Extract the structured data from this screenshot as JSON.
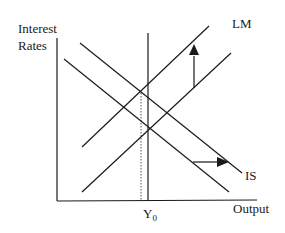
{
  "diagram": {
    "type": "IS-LM model",
    "y_axis_label_line1": "Interest",
    "y_axis_label_line2": "Rates",
    "x_axis_label": "Output",
    "lm_label": "LM",
    "is_label": "IS",
    "y0_label_main": "Y",
    "y0_label_sub": "0",
    "curves": [
      {
        "name": "LM (original)",
        "from": [
          82,
          192
        ],
        "to": [
          231,
          53
        ]
      },
      {
        "name": "LM (shifted up)",
        "from": [
          82,
          147
        ],
        "to": [
          209,
          26
        ]
      },
      {
        "name": "IS (original)",
        "from": [
          64,
          59
        ],
        "to": [
          229,
          192
        ]
      },
      {
        "name": "IS (shifted right)",
        "from": [
          80,
          43
        ],
        "to": [
          242,
          173
        ]
      }
    ],
    "shifts": [
      {
        "curve": "LM",
        "direction": "up"
      },
      {
        "curve": "IS",
        "direction": "right"
      }
    ],
    "line_color": "#1a1a1a"
  }
}
